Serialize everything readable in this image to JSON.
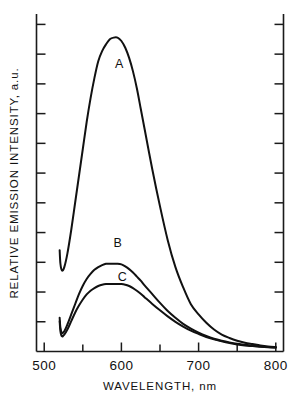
{
  "chart_data": {
    "type": "line",
    "title": "",
    "xlabel": "WAVELENGTH,  nm",
    "ylabel": "RELATIVE EMISSION INTENSITY, a.u.",
    "xlim": [
      490,
      810
    ],
    "ylim": [
      0,
      100
    ],
    "grid": false,
    "legend_position": "inline-annotations",
    "x_major_ticks": [
      500,
      600,
      700,
      800
    ],
    "x_major_tick_labels": [
      "500",
      "600",
      "700",
      "800"
    ],
    "x_minor_ticks": [
      550,
      650,
      750
    ],
    "y_tick_count": 11,
    "y_tick_labels": [],
    "annotations": [
      {
        "text": "A",
        "x": 597,
        "y": 84
      },
      {
        "text": "B",
        "x": 595,
        "y": 31
      },
      {
        "text": "C",
        "x": 601,
        "y": 21
      }
    ],
    "series": [
      {
        "name": "A",
        "label": "A",
        "color": "#111111",
        "peak_x": 595,
        "peak_y": 93,
        "points": [
          [
            520,
            30
          ],
          [
            521,
            26
          ],
          [
            523,
            24
          ],
          [
            526,
            25
          ],
          [
            530,
            29
          ],
          [
            535,
            36
          ],
          [
            540,
            44
          ],
          [
            545,
            52
          ],
          [
            550,
            60
          ],
          [
            555,
            68
          ],
          [
            560,
            75
          ],
          [
            565,
            81
          ],
          [
            570,
            86
          ],
          [
            575,
            89
          ],
          [
            580,
            91
          ],
          [
            585,
            92.5
          ],
          [
            590,
            93
          ],
          [
            595,
            93
          ],
          [
            600,
            92
          ],
          [
            605,
            90
          ],
          [
            610,
            87
          ],
          [
            615,
            83
          ],
          [
            620,
            78
          ],
          [
            625,
            72
          ],
          [
            630,
            66
          ],
          [
            640,
            54
          ],
          [
            650,
            43
          ],
          [
            660,
            33
          ],
          [
            670,
            25
          ],
          [
            680,
            19
          ],
          [
            690,
            14
          ],
          [
            700,
            11
          ],
          [
            710,
            8.5
          ],
          [
            720,
            6.5
          ],
          [
            730,
            5
          ],
          [
            740,
            4
          ],
          [
            750,
            3.2
          ],
          [
            760,
            2.6
          ],
          [
            770,
            2.2
          ],
          [
            780,
            1.8
          ],
          [
            790,
            1.5
          ],
          [
            800,
            1.3
          ]
        ]
      },
      {
        "name": "B",
        "label": "B",
        "color": "#111111",
        "peak_x": 596,
        "peak_y": 26,
        "points": [
          [
            520,
            10
          ],
          [
            521,
            7
          ],
          [
            523,
            5.5
          ],
          [
            526,
            6
          ],
          [
            530,
            8
          ],
          [
            535,
            11
          ],
          [
            540,
            14
          ],
          [
            545,
            17
          ],
          [
            550,
            19.5
          ],
          [
            555,
            21.5
          ],
          [
            560,
            23
          ],
          [
            565,
            24.2
          ],
          [
            570,
            25
          ],
          [
            575,
            25.6
          ],
          [
            580,
            26
          ],
          [
            585,
            26
          ],
          [
            590,
            26
          ],
          [
            595,
            26
          ],
          [
            600,
            25.8
          ],
          [
            605,
            25.2
          ],
          [
            610,
            24.4
          ],
          [
            615,
            23.4
          ],
          [
            620,
            22.2
          ],
          [
            625,
            21
          ],
          [
            630,
            19.6
          ],
          [
            640,
            17
          ],
          [
            650,
            14.4
          ],
          [
            660,
            12
          ],
          [
            670,
            10
          ],
          [
            680,
            8.2
          ],
          [
            690,
            6.8
          ],
          [
            700,
            5.6
          ],
          [
            710,
            4.6
          ],
          [
            720,
            3.8
          ],
          [
            730,
            3.2
          ],
          [
            740,
            2.7
          ],
          [
            750,
            2.3
          ],
          [
            760,
            2.0
          ],
          [
            770,
            1.7
          ],
          [
            780,
            1.5
          ],
          [
            790,
            1.3
          ],
          [
            800,
            1.2
          ]
        ]
      },
      {
        "name": "C",
        "label": "C",
        "color": "#111111",
        "peak_x": 602,
        "peak_y": 20,
        "points": [
          [
            520,
            9
          ],
          [
            521,
            6
          ],
          [
            523,
            4.5
          ],
          [
            526,
            5
          ],
          [
            530,
            6.5
          ],
          [
            535,
            9
          ],
          [
            540,
            11.5
          ],
          [
            545,
            13.6
          ],
          [
            550,
            15.4
          ],
          [
            555,
            16.9
          ],
          [
            560,
            18
          ],
          [
            565,
            18.8
          ],
          [
            570,
            19.4
          ],
          [
            575,
            19.8
          ],
          [
            580,
            20
          ],
          [
            585,
            20
          ],
          [
            590,
            20
          ],
          [
            595,
            20
          ],
          [
            600,
            20
          ],
          [
            605,
            19.8
          ],
          [
            610,
            19.4
          ],
          [
            615,
            18.8
          ],
          [
            620,
            18
          ],
          [
            625,
            17.1
          ],
          [
            630,
            16.1
          ],
          [
            640,
            14.1
          ],
          [
            650,
            12.2
          ],
          [
            660,
            10.4
          ],
          [
            670,
            8.8
          ],
          [
            680,
            7.4
          ],
          [
            690,
            6.2
          ],
          [
            700,
            5.2
          ],
          [
            710,
            4.3
          ],
          [
            720,
            3.6
          ],
          [
            730,
            3.0
          ],
          [
            740,
            2.5
          ],
          [
            750,
            2.1
          ],
          [
            760,
            1.8
          ],
          [
            770,
            1.6
          ],
          [
            780,
            1.4
          ],
          [
            790,
            1.25
          ],
          [
            800,
            1.15
          ]
        ]
      }
    ]
  },
  "figure": {
    "background": "#ffffff",
    "axis_color": "#1a1a1a",
    "curve_color": "#111111"
  }
}
